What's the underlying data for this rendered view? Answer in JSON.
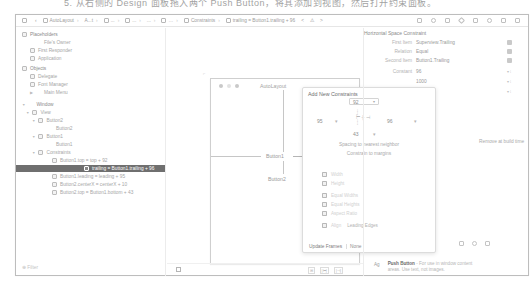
{
  "caption": "5. 从右侧的 Design 面板拖入两个 Push Button，将其添加到视图，然后打开约束面板。",
  "jumpbar": {
    "left_items": [
      "AutoLayout",
      "A...t",
      "...",
      "...",
      "...",
      "Constraints",
      "trailing = Button1.trailing + 96"
    ],
    "nav_arrows": [
      "<",
      "⚠",
      ">"
    ]
  },
  "navigator": {
    "sections": [
      {
        "label": "Placeholders",
        "type": "header",
        "x": 6,
        "y": 3
      },
      {
        "label": "File's Owner",
        "x": 28,
        "y": 11
      },
      {
        "label": "First Responder",
        "x": 14,
        "y": 19,
        "icon": true
      },
      {
        "label": "Application",
        "x": 14,
        "y": 27,
        "icon": true
      },
      {
        "label": "Objects",
        "type": "header",
        "x": 6,
        "y": 37,
        "icon": true
      },
      {
        "label": "Delegate",
        "x": 14,
        "y": 45,
        "icon": true
      },
      {
        "label": "Font Manager",
        "x": 14,
        "y": 53,
        "icon": true
      },
      {
        "label": "Main Menu",
        "x": 18,
        "y": 61,
        "tri": true
      },
      {
        "label": "Window",
        "type": "header",
        "x": 6,
        "y": 73,
        "tri": true
      },
      {
        "label": "View",
        "x": 10,
        "y": 81,
        "tri": true,
        "icon": true
      },
      {
        "label": "Button2",
        "x": 16,
        "y": 89,
        "tri": true,
        "icon": true
      },
      {
        "label": "Button2",
        "x": 40,
        "y": 97
      },
      {
        "label": "Button1",
        "x": 16,
        "y": 105,
        "tri": true,
        "icon": true
      },
      {
        "label": "Button1",
        "x": 40,
        "y": 113
      },
      {
        "label": "Constraints",
        "x": 16,
        "y": 121,
        "tri": true,
        "icon": true
      },
      {
        "label": "Button1.top = top + 92",
        "x": 36,
        "y": 129,
        "icon": true
      },
      {
        "label": "trailing = Button1.trailing + 96",
        "x": 36,
        "y": 137,
        "icon": true,
        "selected": true
      },
      {
        "label": "Button1.leading = leading + 95",
        "x": 36,
        "y": 145,
        "icon": true
      },
      {
        "label": "Button2.centerX = centerX + 10",
        "x": 36,
        "y": 153,
        "icon": true
      },
      {
        "label": "Button2.top = Button1.bottom + 43",
        "x": 36,
        "y": 161,
        "icon": true
      }
    ],
    "filter_placeholder": "Filter"
  },
  "canvas": {
    "window_title": "AutoLayout",
    "button1_label": "Button1",
    "button2_label": "Button2"
  },
  "popover": {
    "title": "Add New Constraints",
    "top_value": "92",
    "left_value": "95",
    "right_value": "96",
    "bottom_value": "43",
    "spacing_label": "Spacing to nearest neighbor",
    "margins_label": "Constrain to margins",
    "checkbox_rows": [
      {
        "label": "Width",
        "y": 84
      },
      {
        "label": "Height",
        "y": 93
      },
      {
        "label": "Equal Widths",
        "y": 105
      },
      {
        "label": "Equal Heights",
        "y": 114
      },
      {
        "label": "Aspect Ratio",
        "y": 123
      },
      {
        "label": "Align",
        "y": 135,
        "extra": "Leading Edges"
      }
    ],
    "update_frames_label": "Update Frames",
    "update_frames_value": "None",
    "add_button_ghost": "Add Constraints"
  },
  "inspector": {
    "title": "Horizontal Space Constraint",
    "rows": [
      {
        "label": "First Item",
        "value": "Superview.Trailing",
        "y": 12,
        "control": "popup"
      },
      {
        "label": "Relation",
        "value": "Equal",
        "y": 21,
        "control": "popup"
      },
      {
        "label": "Second Item",
        "value": "Button1.Trailing",
        "y": 30,
        "control": "popup"
      },
      {
        "label": "Constant",
        "value": "96",
        "y": 41,
        "control": "stepper"
      },
      {
        "label": "Priority",
        "value": "1000",
        "y": 51,
        "control": "stepper"
      },
      {
        "label": "Multiplier",
        "value": "1",
        "y": 61,
        "control": "stepper"
      }
    ],
    "remove_at_build": "Remove at build time",
    "library_item": {
      "icon_text": "Ag",
      "title": "Push Button",
      "description": " - For use in window content areas. Use text, not images."
    }
  },
  "bottom_bar": {
    "tools": [
      "⊞",
      "|⊢|",
      "|⊣|"
    ],
    "resolve_icon": "⊿"
  }
}
